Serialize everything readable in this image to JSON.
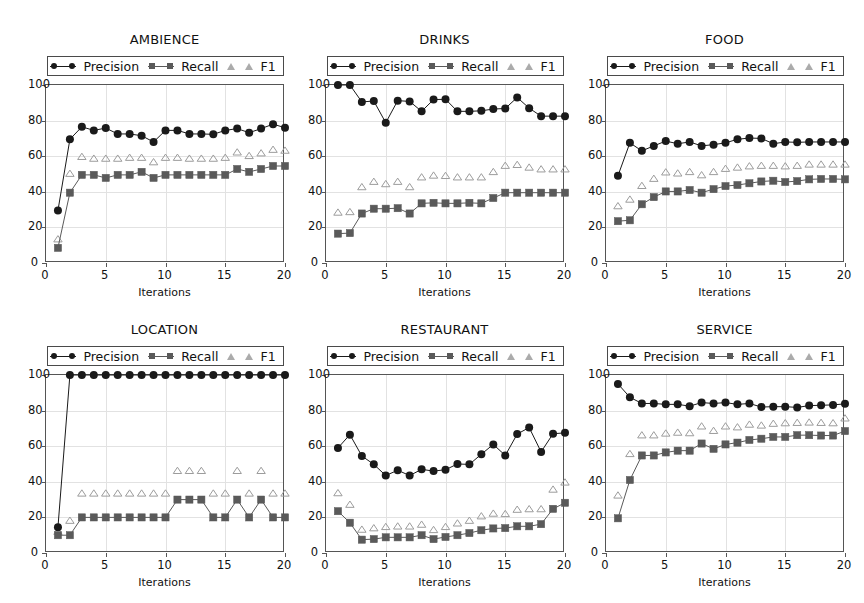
{
  "figure": {
    "width": 864,
    "height": 603,
    "background": "#ffffff",
    "rows": 2,
    "cols": 3
  },
  "legend": {
    "entries": [
      {
        "label": "Precision",
        "marker": "circle",
        "line": true,
        "color": "#1a1a1a"
      },
      {
        "label": "Recall",
        "marker": "square",
        "line": true,
        "color": "#5a5a5a"
      },
      {
        "label": "F1",
        "marker": "triangle-open",
        "line": false,
        "color": "#9c9c9c"
      }
    ]
  },
  "axes": {
    "xlabel": "Iterations",
    "ylabel": "",
    "xticks": [
      0,
      5,
      10,
      15,
      20
    ],
    "yticks": [
      0,
      20,
      40,
      60,
      80,
      100
    ],
    "xlim": [
      0,
      20
    ],
    "ylim": [
      0,
      100
    ],
    "grid": true
  },
  "colors": {
    "precision": "#1a1a1a",
    "recall": "#5a5a5a",
    "f1": "#9c9c9c",
    "grid": "#e2e2e2",
    "frame": "#555555",
    "text": "#111111"
  },
  "chart_data": [
    {
      "type": "line",
      "title": "AMBIENCE",
      "xlabel": "Iterations",
      "ylabel": "",
      "xlim": [
        0,
        20
      ],
      "ylim": [
        0,
        100
      ],
      "grid": true,
      "legend_position": "above-axes",
      "x": [
        1,
        2,
        3,
        4,
        5,
        6,
        7,
        8,
        9,
        10,
        11,
        12,
        13,
        14,
        15,
        16,
        17,
        18,
        19,
        20
      ],
      "series": [
        {
          "name": "Precision",
          "values": [
            29.5,
            69.5,
            76.5,
            74.5,
            75.8,
            72.5,
            72.5,
            71.5,
            68.0,
            74.5,
            74.5,
            72.5,
            72.5,
            72.3,
            74.5,
            75.5,
            73.2,
            75.5,
            78.0,
            76.0
          ]
        },
        {
          "name": "Recall",
          "values": [
            8.5,
            39.5,
            49.5,
            49.5,
            47.8,
            49.5,
            49.5,
            51.2,
            47.8,
            49.5,
            49.5,
            49.5,
            49.5,
            49.5,
            49.5,
            52.8,
            51.2,
            52.8,
            54.5,
            54.5
          ]
        },
        {
          "name": "F1",
          "values": [
            13.2,
            50.0,
            59.5,
            58.5,
            58.5,
            58.5,
            59.0,
            59.0,
            56.5,
            59.0,
            59.0,
            58.5,
            58.5,
            58.5,
            59.0,
            62.0,
            60.0,
            61.5,
            63.5,
            63.0
          ]
        }
      ]
    },
    {
      "type": "line",
      "title": "DRINKS",
      "xlabel": "Iterations",
      "ylabel": "",
      "xlim": [
        0,
        20
      ],
      "ylim": [
        0,
        100
      ],
      "grid": true,
      "legend_position": "above-axes",
      "x": [
        1,
        2,
        3,
        4,
        5,
        6,
        7,
        8,
        9,
        10,
        11,
        12,
        13,
        14,
        15,
        16,
        17,
        18,
        19,
        20
      ],
      "series": [
        {
          "name": "Precision",
          "values": [
            100.0,
            100.0,
            90.5,
            91.0,
            78.8,
            91.2,
            90.8,
            85.2,
            91.8,
            92.0,
            85.2,
            85.2,
            85.5,
            86.5,
            86.8,
            93.0,
            87.0,
            82.5,
            82.5,
            82.5
          ]
        },
        {
          "name": "Recall",
          "values": [
            16.5,
            16.8,
            27.8,
            30.5,
            30.5,
            30.8,
            27.8,
            33.5,
            33.8,
            33.5,
            33.5,
            33.8,
            33.5,
            36.5,
            39.5,
            39.5,
            39.5,
            39.5,
            39.5,
            39.5
          ]
        },
        {
          "name": "F1",
          "values": [
            28.2,
            28.5,
            42.5,
            45.5,
            44.2,
            45.5,
            42.5,
            48.0,
            49.0,
            48.8,
            48.0,
            48.0,
            48.0,
            51.0,
            54.5,
            55.0,
            53.5,
            52.5,
            52.5,
            52.5
          ]
        }
      ]
    },
    {
      "type": "line",
      "title": "FOOD",
      "xlabel": "Iterations",
      "ylabel": "",
      "xlim": [
        0,
        20
      ],
      "ylim": [
        0,
        100
      ],
      "grid": true,
      "legend_position": "above-axes",
      "x": [
        1,
        2,
        3,
        4,
        5,
        6,
        7,
        8,
        9,
        10,
        11,
        12,
        13,
        14,
        15,
        16,
        17,
        18,
        19,
        20
      ],
      "series": [
        {
          "name": "Precision",
          "values": [
            49.0,
            67.5,
            63.0,
            65.8,
            68.5,
            67.0,
            68.0,
            65.8,
            66.5,
            67.5,
            69.5,
            70.2,
            70.0,
            67.0,
            68.0,
            67.8,
            68.0,
            68.0,
            68.0,
            68.0
          ]
        },
        {
          "name": "Recall",
          "values": [
            23.5,
            24.0,
            33.0,
            37.0,
            40.2,
            40.2,
            41.0,
            39.5,
            41.5,
            43.2,
            43.8,
            44.8,
            45.8,
            46.2,
            45.5,
            46.0,
            47.0,
            47.2,
            47.2,
            47.0
          ]
        },
        {
          "name": "F1",
          "values": [
            31.8,
            35.5,
            43.2,
            47.2,
            50.8,
            50.2,
            51.0,
            49.2,
            51.0,
            52.8,
            53.5,
            54.2,
            54.5,
            54.5,
            54.2,
            54.5,
            55.2,
            55.2,
            55.2,
            55.2
          ]
        }
      ]
    },
    {
      "type": "line",
      "title": "LOCATION",
      "xlabel": "Iterations",
      "ylabel": "",
      "xlim": [
        0,
        20
      ],
      "ylim": [
        0,
        100
      ],
      "grid": true,
      "legend_position": "above-axes",
      "x": [
        1,
        2,
        3,
        4,
        5,
        6,
        7,
        8,
        9,
        10,
        11,
        12,
        13,
        14,
        15,
        16,
        17,
        18,
        19,
        20
      ],
      "series": [
        {
          "name": "Precision",
          "values": [
            14.5,
            100.0,
            100.0,
            100.0,
            100.0,
            100.0,
            100.0,
            100.0,
            100.0,
            100.0,
            100.0,
            100.0,
            100.0,
            100.0,
            100.0,
            100.0,
            100.0,
            100.0,
            100.0,
            100.0
          ]
        },
        {
          "name": "Recall",
          "values": [
            10.0,
            10.0,
            20.0,
            20.0,
            20.0,
            20.0,
            20.0,
            20.0,
            20.0,
            20.0,
            30.0,
            30.0,
            30.0,
            20.0,
            20.0,
            30.0,
            20.0,
            30.0,
            20.0,
            20.0
          ]
        },
        {
          "name": "F1",
          "values": [
            11.8,
            18.0,
            33.3,
            33.3,
            33.3,
            33.3,
            33.3,
            33.3,
            33.3,
            33.3,
            46.0,
            46.0,
            46.0,
            33.3,
            33.3,
            46.0,
            33.3,
            46.0,
            33.3,
            33.3
          ]
        }
      ]
    },
    {
      "type": "line",
      "title": "RESTAURANT",
      "xlabel": "Iterations",
      "ylabel": "",
      "xlim": [
        0,
        20
      ],
      "ylim": [
        0,
        100
      ],
      "grid": true,
      "legend_position": "above-axes",
      "x": [
        1,
        2,
        3,
        4,
        5,
        6,
        7,
        8,
        9,
        10,
        11,
        12,
        13,
        14,
        15,
        16,
        17,
        18,
        19,
        20
      ],
      "series": [
        {
          "name": "Precision",
          "values": [
            59.0,
            66.5,
            54.5,
            49.8,
            43.5,
            46.5,
            43.5,
            47.0,
            46.0,
            46.8,
            50.0,
            49.8,
            55.5,
            61.0,
            54.8,
            66.8,
            70.5,
            56.8,
            67.0,
            67.5
          ]
        },
        {
          "name": "Recall",
          "values": [
            23.5,
            17.0,
            7.5,
            7.8,
            8.8,
            8.8,
            8.8,
            10.0,
            7.8,
            9.0,
            10.0,
            11.2,
            12.8,
            13.8,
            14.0,
            15.0,
            15.0,
            16.2,
            24.8,
            28.2
          ]
        },
        {
          "name": "F1",
          "values": [
            33.5,
            27.0,
            13.0,
            13.8,
            14.5,
            14.8,
            14.8,
            15.8,
            12.8,
            14.5,
            16.5,
            18.0,
            20.5,
            22.0,
            21.8,
            24.2,
            24.5,
            24.5,
            35.5,
            39.5
          ]
        }
      ]
    },
    {
      "type": "line",
      "title": "SERVICE",
      "xlabel": "Iterations",
      "ylabel": "",
      "xlim": [
        0,
        20
      ],
      "ylim": [
        0,
        100
      ],
      "grid": true,
      "legend_position": "above-axes",
      "x": [
        1,
        2,
        3,
        4,
        5,
        6,
        7,
        8,
        9,
        10,
        11,
        12,
        13,
        14,
        15,
        16,
        17,
        18,
        19,
        20
      ],
      "series": [
        {
          "name": "Precision",
          "values": [
            95.0,
            87.5,
            84.0,
            84.0,
            83.5,
            83.5,
            82.5,
            84.5,
            84.0,
            84.5,
            83.5,
            84.0,
            82.0,
            82.2,
            82.2,
            81.8,
            82.8,
            83.0,
            83.2,
            83.8
          ]
        },
        {
          "name": "Recall",
          "values": [
            19.5,
            41.0,
            54.8,
            54.8,
            56.5,
            57.5,
            57.5,
            61.5,
            58.5,
            61.0,
            62.0,
            63.5,
            64.2,
            65.2,
            65.2,
            66.2,
            66.2,
            66.0,
            66.0,
            68.5
          ]
        },
        {
          "name": "F1",
          "values": [
            32.2,
            55.5,
            66.0,
            66.0,
            67.0,
            67.5,
            67.2,
            71.0,
            68.5,
            71.0,
            70.5,
            72.0,
            71.5,
            72.5,
            72.8,
            73.0,
            73.2,
            73.0,
            72.8,
            75.5
          ]
        }
      ]
    }
  ]
}
